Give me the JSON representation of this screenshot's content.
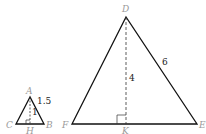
{
  "diagram": {
    "small_triangle": {
      "vertices": {
        "A": "A",
        "B": "B",
        "C": "C"
      },
      "foot": "H",
      "side_label": "1.5",
      "altitude_label": "1"
    },
    "large_triangle": {
      "vertices": {
        "D": "D",
        "E": "E",
        "F": "F"
      },
      "foot": "K",
      "side_label": "6",
      "altitude_label": "4"
    },
    "colors": {
      "line": "#111111",
      "label": "#9a9a9a",
      "number": "#222222"
    }
  }
}
